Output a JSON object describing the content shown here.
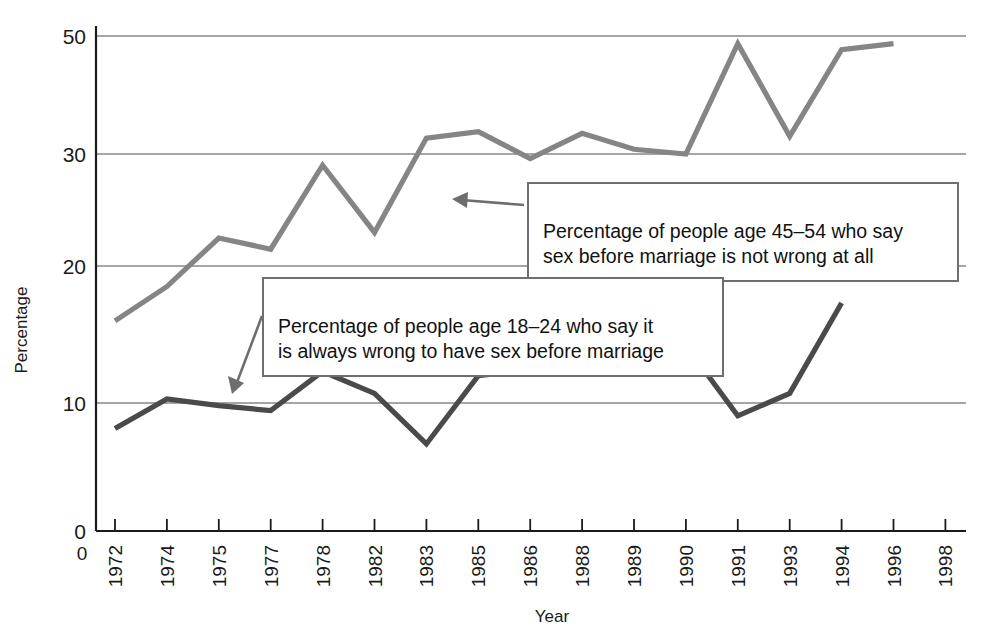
{
  "chart_data": {
    "type": "line",
    "title": "",
    "xlabel": "Year",
    "ylabel": "Percentage",
    "grid": true,
    "legend_position": "annotations-inline",
    "categories": [
      "1972",
      "1974",
      "1975",
      "1977",
      "1978",
      "1982",
      "1983",
      "1985",
      "1986",
      "1988",
      "1989",
      "1990",
      "1991",
      "1993",
      "1994",
      "1996",
      "1998"
    ],
    "y_ticks": [
      0,
      10,
      20,
      30,
      50
    ],
    "ylim": [
      0,
      52
    ],
    "series": [
      {
        "name": "Percentage of people age 45-54 who say sex before marriage is not wrong at all",
        "color": "#858585",
        "values": [
          16.0,
          18.5,
          22.5,
          21.5,
          29.0,
          23.0,
          32.7,
          33.8,
          29.6,
          33.5,
          30.8,
          30.0,
          48.7,
          33.0,
          47.7,
          48.7,
          null
        ]
      },
      {
        "name": "Percentage of people age 18-24 who say it is always wrong to have sex before marriage",
        "color": "#4a4a4a",
        "values": [
          8.0,
          10.3,
          9.8,
          9.4,
          12.3,
          10.7,
          6.8,
          12.0,
          12.4,
          12.7,
          15.1,
          14.2,
          9.0,
          10.7,
          17.3,
          null,
          null
        ]
      }
    ]
  },
  "axes": {
    "y_label": "Percentage",
    "x_label": "Year",
    "y_tick_labels": [
      "50",
      "30",
      "20",
      "10",
      "0"
    ],
    "x_origin_label": "0",
    "x_tick_labels": [
      "1972",
      "1974",
      "1975",
      "1977",
      "1978",
      "1982",
      "1983",
      "1985",
      "1986",
      "1988",
      "1989",
      "1990",
      "1991",
      "1993",
      "1994",
      "1996",
      "1998"
    ]
  },
  "annotations": {
    "upper": {
      "line1": "Percentage of people age 45–54 who say",
      "line2": "sex before marriage is not wrong at all",
      "text": "Percentage of people age 45–54 who say\nsex before marriage is not wrong at all"
    },
    "lower": {
      "line1": "Percentage of people age 18–24 who say it",
      "line2": "is always wrong to have sex before marriage",
      "text": "Percentage of people age 18–24 who say it\nis always wrong to have sex before marriage"
    }
  },
  "colors": {
    "series_upper": "#858585",
    "series_lower": "#4a4a4a",
    "gridline": "#878787",
    "axis": "#1a1a1a",
    "callout_border": "#6e6e6e",
    "background": "#ffffff"
  }
}
